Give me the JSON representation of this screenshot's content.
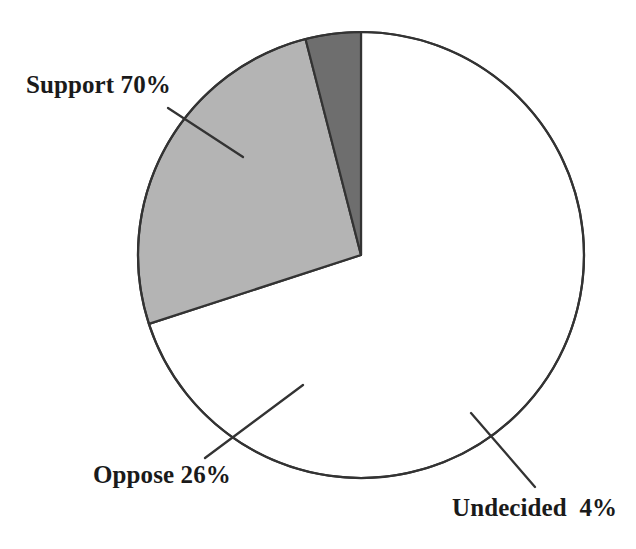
{
  "chart_data": {
    "type": "pie",
    "title": "",
    "subtitle": "",
    "xlabel": "",
    "ylabel": "",
    "legend_position": "none",
    "grid": false,
    "units": "percent",
    "total": 100,
    "start_angle_deg": 0,
    "direction": "clockwise",
    "categories": [
      "Support",
      "Oppose",
      "Undecided"
    ],
    "values": [
      70,
      26,
      4
    ],
    "slices": [
      {
        "name": "Support",
        "value": 70,
        "label": "Support 70%",
        "percent_text": "70%",
        "fill": "#ffffff",
        "stroke": "#333333",
        "start_deg": 0,
        "sweep_deg": 252,
        "leader_line": true
      },
      {
        "name": "Oppose",
        "value": 26,
        "label": "Oppose 26%",
        "percent_text": "26%",
        "fill": "#b4b4b4",
        "stroke": "#333333",
        "start_deg": 252,
        "sweep_deg": 93.6,
        "leader_line": true
      },
      {
        "name": "Undecided",
        "value": 4,
        "label": "Undecided  4%",
        "percent_text": "4%",
        "fill": "#6e6e6e",
        "stroke": "#333333",
        "start_deg": 345.6,
        "sweep_deg": 14.4,
        "leader_line": true
      }
    ],
    "geometry": {
      "center_x": 361,
      "center_y": 255,
      "radius": 223
    },
    "colors": {
      "background": "#ffffff",
      "outline": "#333333",
      "support_fill": "#ffffff",
      "oppose_fill": "#b4b4b4",
      "undecided_fill": "#6e6e6e",
      "label_text": "#1a1a1a",
      "leader_line": "#333333"
    }
  }
}
